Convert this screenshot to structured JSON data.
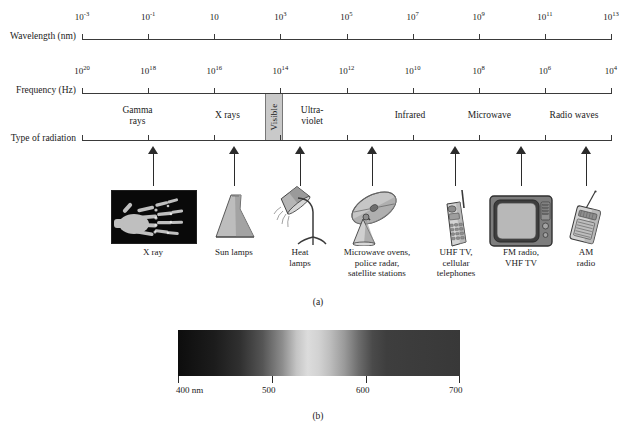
{
  "figure": {
    "panel_a_label": "(a)",
    "panel_b_label": "(b)"
  },
  "axes": {
    "wavelength": {
      "name": "Wavelength (nm)",
      "ticks": [
        "10−3",
        "10−1",
        "10",
        "10³",
        "10⁵",
        "10⁷",
        "10⁹",
        "10¹¹",
        "10¹³"
      ],
      "tick_mantissas": [
        "10",
        "10",
        "10",
        "10",
        "10",
        "10",
        "10",
        "10",
        "10"
      ],
      "tick_exponents": [
        "-3",
        "-1",
        "",
        "3",
        "5",
        "7",
        "9",
        "11",
        "13"
      ]
    },
    "frequency": {
      "name": "Frequency (Hz)",
      "tick_mantissas": [
        "10",
        "10",
        "10",
        "10",
        "10",
        "10",
        "10",
        "10",
        "10"
      ],
      "tick_exponents": [
        "20",
        "18",
        "16",
        "14",
        "12",
        "10",
        "8",
        "6",
        "4"
      ]
    },
    "radiation": {
      "name": "Type of radiation"
    }
  },
  "bands": [
    {
      "label_line1": "Gamma",
      "label_line2": "rays",
      "center_pct": 10.5
    },
    {
      "label_line1": "X rays",
      "label_line2": "",
      "center_pct": 27.5
    },
    {
      "label_line1": "Ultra-",
      "label_line2": "violet",
      "center_pct": 43.5
    },
    {
      "label_line1": "Infrared",
      "label_line2": "",
      "center_pct": 62.0
    },
    {
      "label_line1": "Microwave",
      "label_line2": "",
      "center_pct": 77.0
    },
    {
      "label_line1": "Radio waves",
      "label_line2": "",
      "center_pct": 93.0
    }
  ],
  "visible": {
    "label": "Visible"
  },
  "sources": [
    {
      "name": "x-ray-image",
      "caption": [
        "X ray"
      ],
      "icon": "hand-xray-photo"
    },
    {
      "name": "sun-lamp",
      "caption": [
        "Sun lamps"
      ],
      "icon": "sun-lamp-icon"
    },
    {
      "name": "heat-lamp",
      "caption": [
        "Heat",
        "lamps"
      ],
      "icon": "heat-lamp-icon"
    },
    {
      "name": "satellite-dish",
      "caption": [
        "Microwave ovens,",
        "police radar,",
        "satellite stations"
      ],
      "icon": "satellite-dish-icon"
    },
    {
      "name": "cell-phone",
      "caption": [
        "UHF TV,",
        "cellular",
        "telephones"
      ],
      "icon": "cell-phone-icon"
    },
    {
      "name": "television",
      "caption": [
        "FM radio,",
        "VHF TV"
      ],
      "icon": "television-icon"
    },
    {
      "name": "am-radio",
      "caption": [
        "AM",
        "radio"
      ],
      "icon": "portable-radio-icon"
    }
  ],
  "visible_spectrum": {
    "ticks": [
      {
        "label": "400 nm",
        "value": 400
      },
      {
        "label": "500",
        "value": 500
      },
      {
        "label": "600",
        "value": 600
      },
      {
        "label": "700",
        "value": 700
      }
    ],
    "range_nm": [
      400,
      700
    ]
  },
  "colors": {
    "ink": "#1a1a1a",
    "rule": "#3a3a3a",
    "visible_box_fill": "#c9c9c9",
    "page_background": "#ffffff"
  }
}
